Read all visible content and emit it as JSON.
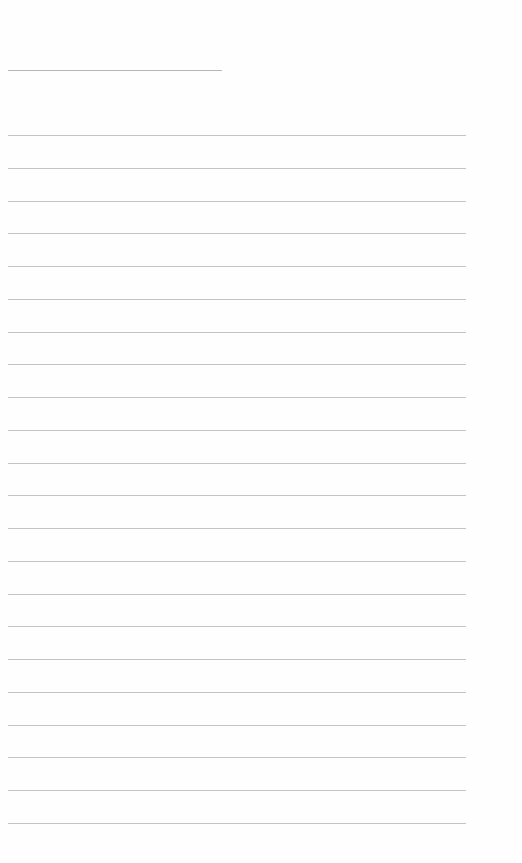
{
  "document": {
    "type": "blank lined page",
    "title_line": {
      "text": ""
    },
    "lines": [
      "",
      "",
      "",
      "",
      "",
      "",
      "",
      "",
      "",
      "",
      "",
      "",
      "",
      "",
      "",
      "",
      "",
      "",
      "",
      "",
      "",
      ""
    ]
  }
}
